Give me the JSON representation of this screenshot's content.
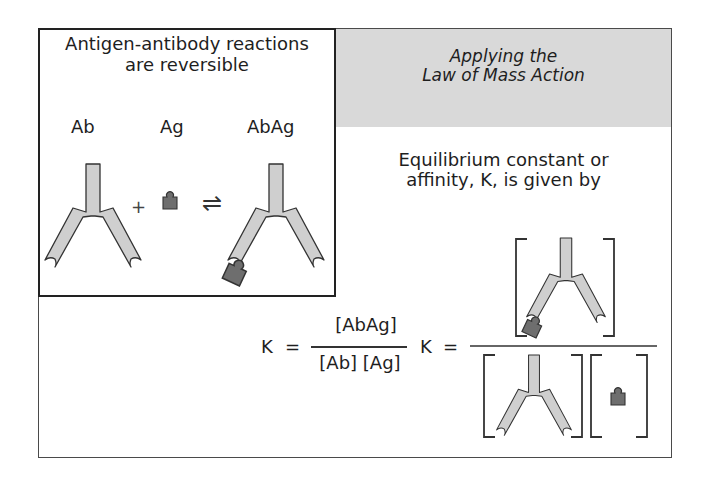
{
  "left_panel": {
    "title_line1": "Antigen-antibody reactions",
    "title_line2": "are reversible",
    "labels": {
      "antibody": "Ab",
      "antigen": "Ag",
      "complex": "AbAg"
    },
    "plus_sign": "+",
    "equilibrium_arrow": "⇌"
  },
  "right_panel": {
    "header_line1": "Applying the",
    "header_line2": "Law of Mass Action",
    "description_line1": "Equilibrium constant or",
    "description_line2": "affinity, K, is given by"
  },
  "formula": {
    "lhs": "K",
    "equals": "=",
    "numerator": "[AbAg]",
    "denominator": "[Ab] [Ag]",
    "lhs2": "K",
    "equals2": "="
  },
  "colors": {
    "antibody_fill": "#cfcfcf",
    "antigen_fill": "#6e6e6e",
    "header_band": "#d9d9d9",
    "stroke": "#333333"
  }
}
